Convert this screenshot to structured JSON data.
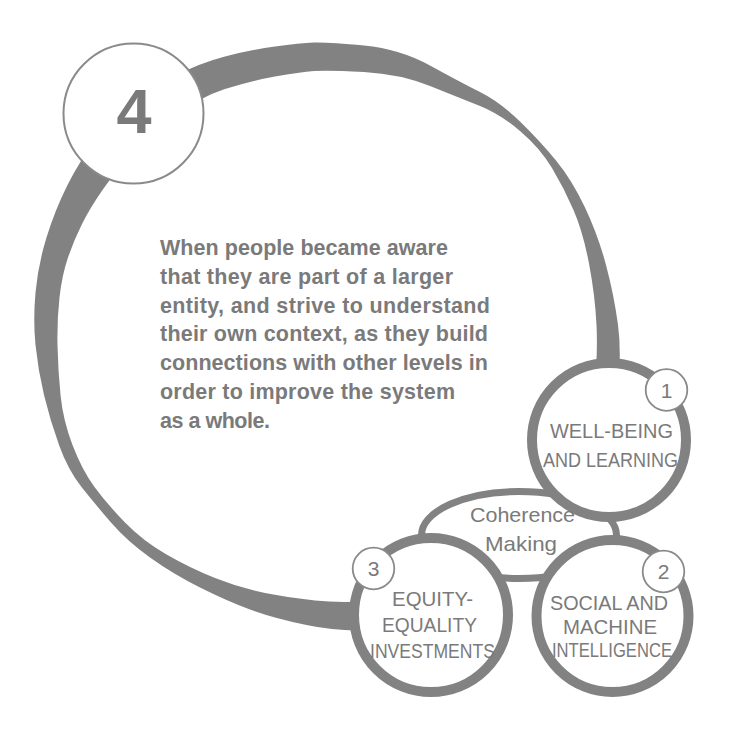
{
  "diagram": {
    "stage": {
      "number": "4",
      "description_lines": [
        "When people became aware",
        "that they are part of a larger",
        "entity, and strive to understand",
        "their own context, as they build",
        "connections with other levels in",
        "order to improve the system",
        "as a whole."
      ]
    },
    "core": {
      "label_lines": [
        "Coherence",
        "Making"
      ]
    },
    "nodes": [
      {
        "number": "1",
        "label_lines": [
          "WELL-BEING",
          "AND LEARNING"
        ]
      },
      {
        "number": "2",
        "label_lines": [
          "SOCIAL AND",
          "MACHINE",
          "INTELLIGENCE"
        ]
      },
      {
        "number": "3",
        "label_lines": [
          "EQUITY-",
          "EQUALITY",
          "INVESTMENTS"
        ]
      }
    ]
  },
  "colors": {
    "ring": "#828282",
    "text": "#7a7a7a",
    "outline": "#8a8a8a",
    "background": "#ffffff"
  }
}
